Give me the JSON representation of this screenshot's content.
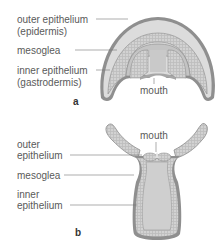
{
  "figure_a": {
    "letter": "a",
    "labels": {
      "outer_line1": "outer epithelium",
      "outer_line2": "(epidermis)",
      "mesoglea": "mesoglea",
      "inner_line1": "inner epithelium",
      "inner_line2": "(gastrodermis)",
      "mouth": "mouth"
    }
  },
  "figure_b": {
    "letter": "b",
    "labels": {
      "outer_line1": "outer",
      "outer_line2": "epithelium",
      "mesoglea": "mesoglea",
      "inner_line1": "inner",
      "inner_line2": "epithelium",
      "mouth": "mouth"
    }
  },
  "colors": {
    "outer_layer": "#8f8f8f",
    "mesoglea": "#d9d9d9",
    "cell_layer": "#b5b5b5",
    "cavity": "#c8c8c8",
    "leader_line": "#777777"
  }
}
